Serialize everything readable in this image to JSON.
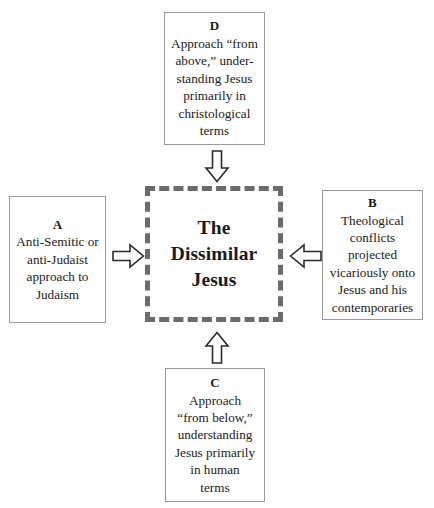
{
  "diagram": {
    "center": {
      "label": "The\nDissimilar\nJesus"
    },
    "nodes": [
      {
        "id": "D",
        "tag": "D",
        "text": "Approach “from\nabove,” under-\nstanding Jesus\nprimarily in\nchristological\nterms",
        "position": "top"
      },
      {
        "id": "A",
        "tag": "A",
        "text": "Anti-Semitic or\nanti-Judaist\napproach to\nJudaism",
        "position": "left"
      },
      {
        "id": "B",
        "tag": "B",
        "text": "Theological\nconflicts\nprojected\nvicariously onto\nJesus and his\ncontemporaries",
        "position": "right"
      },
      {
        "id": "C",
        "tag": "C",
        "text": "Approach\n“from below,”\nunderstanding\nJesus primarily\nin human\nterms",
        "position": "bottom"
      }
    ],
    "arrows": [
      {
        "name": "arrow-down-icon",
        "direction": "down",
        "from": "D",
        "to": "center"
      },
      {
        "name": "arrow-right-icon",
        "direction": "right",
        "from": "A",
        "to": "center"
      },
      {
        "name": "arrow-left-icon",
        "direction": "left",
        "from": "B",
        "to": "center"
      },
      {
        "name": "arrow-up-icon",
        "direction": "up",
        "from": "C",
        "to": "center"
      }
    ],
    "colors": {
      "box_border": "#9a9a9a",
      "center_border": "#6b6b6b",
      "text": "#1a1a1a",
      "background": "#ffffff"
    }
  }
}
